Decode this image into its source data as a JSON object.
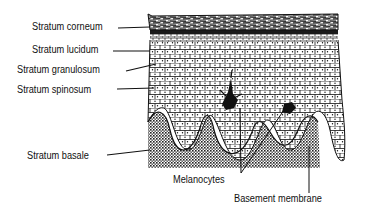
{
  "diagram": {
    "labels": {
      "stratum_corneum": "Stratum corneum",
      "stratum_lucidum": "Stratum lucidum",
      "stratum_granulosum": "Stratum granulosum",
      "stratum_spinosum": "Stratum spinosum",
      "stratum_basale": "Stratum basale",
      "melanocytes": "Melanocytes",
      "basement_membrane": "Basement membrane"
    },
    "colors": {
      "ink": "#111111",
      "background": "#ffffff"
    }
  }
}
